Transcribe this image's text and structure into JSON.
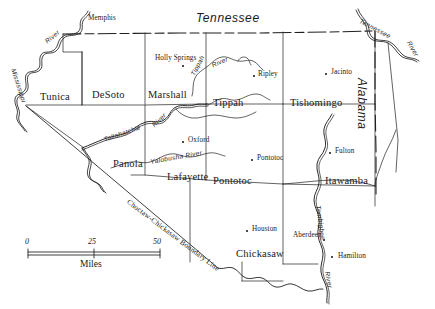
{
  "map": {
    "title": "North Mississippi Counties",
    "ink_color": "#1a1a1a",
    "background_color": "#ffffff",
    "states": [
      {
        "name": "Tennessee",
        "x": 196,
        "y": 12,
        "rotation": 0
      },
      {
        "name": "Alabama",
        "x": 376,
        "y": 80,
        "rotation": 90
      }
    ],
    "counties": [
      {
        "name": "Tunica",
        "x": 48,
        "y": 92
      },
      {
        "name": "DeSoto",
        "x": 99,
        "y": 90
      },
      {
        "name": "Marshall",
        "x": 152,
        "y": 90
      },
      {
        "name": "Tippah",
        "x": 216,
        "y": 97
      },
      {
        "name": "Tishomingo",
        "x": 292,
        "y": 97
      },
      {
        "name": "Panola",
        "x": 116,
        "y": 159
      },
      {
        "name": "Lafayette",
        "x": 171,
        "y": 173
      },
      {
        "name": "Pontotoc",
        "x": 216,
        "y": 177
      },
      {
        "name": "Itawamba",
        "x": 328,
        "y": 177
      },
      {
        "name": "Chickasaw",
        "x": 240,
        "y": 251
      }
    ],
    "cities": [
      {
        "name": "Memphis",
        "label_x": 88,
        "label_y": 18,
        "dot_x": null,
        "dot_y": null
      },
      {
        "name": "Holly Springs",
        "label_x": 154,
        "label_y": 57,
        "dot_x": 182,
        "dot_y": 65,
        "two_line": true
      },
      {
        "name": "Ripley",
        "label_x": 258,
        "label_y": 73,
        "dot_x": 253,
        "dot_y": 75
      },
      {
        "name": "Jacinto",
        "label_x": 332,
        "label_y": 70,
        "dot_x": 325,
        "dot_y": 73
      },
      {
        "name": "Oxford",
        "label_x": 188,
        "label_y": 139,
        "dot_x": 182,
        "dot_y": 141
      },
      {
        "name": "Pontotoc",
        "label_x": 257,
        "label_y": 157,
        "dot_x": 251,
        "dot_y": 159
      },
      {
        "name": "Fulton",
        "label_x": 335,
        "label_y": 150,
        "dot_x": 329,
        "dot_y": 152
      },
      {
        "name": "Houston",
        "label_x": 252,
        "label_y": 228,
        "dot_x": 246,
        "dot_y": 230
      },
      {
        "name": "Aberdeen",
        "label_x": 294,
        "label_y": 233,
        "dot_x": 323,
        "dot_y": 239
      },
      {
        "name": "Hamilton",
        "label_x": 338,
        "label_y": 255,
        "dot_x": 331,
        "dot_y": 256
      }
    ],
    "rivers": [
      {
        "name": "Mississippi",
        "x": 16,
        "y": 72,
        "rotation": 72
      },
      {
        "name": "River",
        "x": 47,
        "y": 38,
        "rotation": -40
      },
      {
        "name": "Tallahatchie",
        "x": 106,
        "y": 136,
        "rotation": -19
      },
      {
        "name": "River",
        "x": 152,
        "y": 122,
        "rotation": -44
      },
      {
        "name": "Tippah",
        "x": 192,
        "y": 70,
        "rotation": -62
      },
      {
        "name": "River",
        "x": 212,
        "y": 62,
        "rotation": -24
      },
      {
        "name": "Yalobusha River",
        "x": 151,
        "y": 158,
        "rotation": -10
      },
      {
        "name": "Tennessee",
        "x": 363,
        "y": 20,
        "rotation": 28
      },
      {
        "name": "River",
        "x": 411,
        "y": 42,
        "rotation": 60
      },
      {
        "name": "Tombigbee",
        "x": 322,
        "y": 207,
        "rotation": 82
      },
      {
        "name": "River",
        "x": 330,
        "y": 272,
        "rotation": 80
      }
    ],
    "boundary_line": {
      "label": "Choctaw-Chickasaw Boundary Line",
      "label_x": 130,
      "label_y": 198,
      "rotation": 37
    },
    "scale_bar": {
      "unit_label": "Miles",
      "ticks": [
        "0",
        "25",
        "50"
      ],
      "x": 28,
      "y": 241,
      "width": 132
    }
  }
}
